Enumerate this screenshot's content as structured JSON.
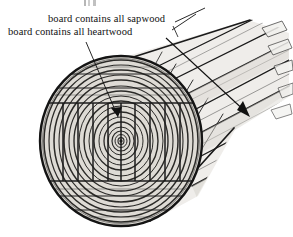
{
  "figure": {
    "background_color": "#ffffff",
    "ink_color": "#111111",
    "wood_fill_light": "#e9e7e3",
    "wood_fill_mid": "#cfccc6",
    "wood_fill_dark": "#a9a59e"
  },
  "labels": {
    "sapwood": {
      "text": "board contains all sapwood",
      "points_to": "outer board at top of log"
    },
    "heartwood": {
      "text": "board contains all heartwood",
      "points_to": "central board through the pith"
    }
  },
  "annotations": {
    "heartwood_leader": "line from heartwood label down-right to arrowhead at log center band",
    "sapwood_leader": "line from sapwood label up-right to outermost board face",
    "long_arrow": "long diagonal arrow running down-right along the board length"
  },
  "log": {
    "cross_section": {
      "center_x": 121,
      "center_y": 141,
      "radius_x": 81,
      "radius_y": 85,
      "growth_rings": 17,
      "pith_label": "pith"
    },
    "saw_cuts": {
      "vertical_kerf_count": 9,
      "horizontal_band_count": 5,
      "description": "square cant cut into vertical boards with horizontal slab bands above and below"
    },
    "perspective_boards": {
      "count": 7,
      "direction": "upper-right",
      "end_style": "staggered jagged board tips"
    }
  }
}
